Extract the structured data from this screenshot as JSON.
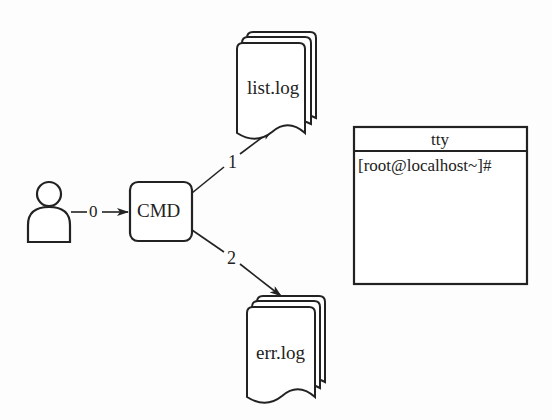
{
  "diagram": {
    "user": {
      "icon": "user-icon"
    },
    "cmd": {
      "label": "CMD"
    },
    "edges": [
      {
        "from": "user",
        "to": "cmd",
        "label": "0"
      },
      {
        "from": "cmd",
        "to": "list.log",
        "label": "1"
      },
      {
        "from": "cmd",
        "to": "err.log",
        "label": "2"
      }
    ],
    "files": {
      "stdout": {
        "label": "list.log",
        "icon": "multi-document-icon"
      },
      "stderr": {
        "label": "err.log",
        "icon": "multi-document-icon"
      }
    },
    "tty": {
      "title": "tty",
      "prompt": "[root@localhost~]#"
    }
  }
}
